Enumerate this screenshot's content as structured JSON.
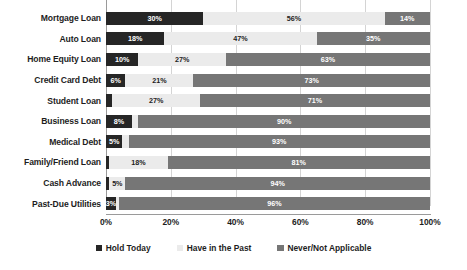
{
  "chart_data": {
    "type": "bar",
    "subtype": "stacked-horizontal-100pct",
    "title": "",
    "xlabel": "",
    "ylabel": "",
    "xlim": [
      0,
      100
    ],
    "xticks": [
      "0%",
      "20%",
      "40%",
      "60%",
      "80%",
      "100%"
    ],
    "grid": true,
    "legend_position": "bottom-center",
    "categories": [
      "Mortgage Loan",
      "Auto Loan",
      "Home Equity Loan",
      "Credit Card Debt",
      "Student Loan",
      "Business Loan",
      "Medical Debt",
      "Family/Friend Loan",
      "Cash Advance",
      "Past-Due Utilities"
    ],
    "series": [
      {
        "name": "Hold Today",
        "color": "#262626",
        "values": [
          30,
          18,
          10,
          6,
          2,
          8,
          5,
          1,
          1,
          3
        ],
        "labels": [
          "30%",
          "18%",
          "10%",
          "6%",
          "",
          "8%",
          "5%",
          "",
          "",
          "3%"
        ]
      },
      {
        "name": "Have in the Past",
        "color": "#ebebeb",
        "values": [
          56,
          47,
          27,
          21,
          27,
          2,
          2,
          18,
          5,
          1
        ],
        "labels": [
          "56%",
          "47%",
          "27%",
          "21%",
          "27%",
          "",
          "",
          "18%",
          "5%",
          ""
        ]
      },
      {
        "name": "Never/Not Applicable",
        "color": "#767676",
        "values": [
          14,
          35,
          63,
          73,
          71,
          90,
          93,
          81,
          94,
          96
        ],
        "labels": [
          "14%",
          "35%",
          "63%",
          "73%",
          "71%",
          "90%",
          "93%",
          "81%",
          "94%",
          "96%"
        ]
      }
    ]
  },
  "legend": {
    "items": [
      {
        "label": "Hold Today",
        "swatch_class": "sw-hold"
      },
      {
        "label": "Have in the Past",
        "swatch_class": "sw-past"
      },
      {
        "label": "Never/Not Applicable",
        "swatch_class": "sw-never"
      }
    ]
  },
  "colors": {
    "hold_today": "#262626",
    "have_in_past": "#ebebeb",
    "never_not_applicable": "#767676",
    "gridline": "#d4d4d4",
    "axis": "#9a9a9a",
    "background": "#ffffff",
    "text": "#1d1d1d"
  }
}
